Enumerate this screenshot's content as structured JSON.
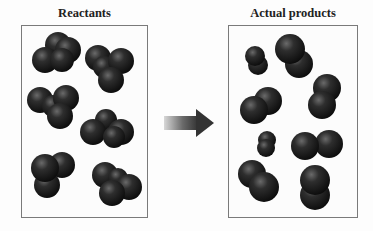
{
  "diagram": {
    "left_panel": {
      "title": "Reactants"
    },
    "right_panel": {
      "title": "Actual products"
    },
    "arrow": {
      "direction": "right",
      "meaning": "reaction"
    }
  },
  "colors": {
    "molecule": "#1e1e1e",
    "border": "#7a7a7a",
    "arrow": "#3a3a3a"
  }
}
